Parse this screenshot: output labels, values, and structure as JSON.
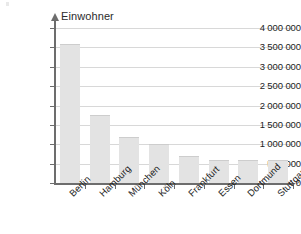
{
  "chart_data": {
    "type": "bar",
    "title": "",
    "axis_title": "Einwohner",
    "xlabel": "",
    "ylabel": "Einwohner",
    "categories": [
      "Berlin",
      "Hamburg",
      "München",
      "Köln",
      "Frankfurt",
      "Essen",
      "Dortmund",
      "Stuttgart"
    ],
    "values": [
      3580000,
      1750000,
      1200000,
      1000000,
      700000,
      600000,
      600000,
      600000
    ],
    "ylim": [
      0,
      4000000
    ],
    "ytick_values": [
      0,
      500000,
      1000000,
      1500000,
      2000000,
      2500000,
      3000000,
      3500000,
      4000000
    ],
    "ytick_labels": [
      "0",
      "500 000",
      "1 000 000",
      "1 500 000",
      "2 000 000",
      "2 500 000",
      "3 000 000",
      "3 500 000",
      "4 000 000"
    ],
    "grid": true,
    "legend": null,
    "bar_color": "#e3e3e3",
    "axis_color": "#6d6d6d",
    "grid_color": "#d8d8d8",
    "text_color": "#1d1d1d"
  }
}
